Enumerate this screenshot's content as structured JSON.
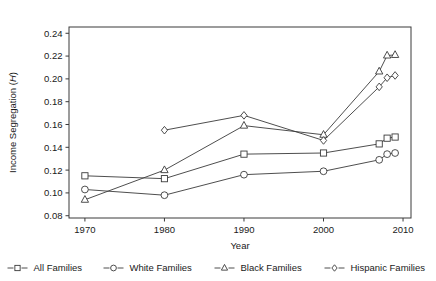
{
  "chart_data": {
    "type": "line",
    "title": "",
    "xlabel": "Year",
    "ylabel": "Income Segregation (H)",
    "ylabel_plain": "Income Segregation (",
    "ylabel_italic": "H",
    "ylabel_close": ")",
    "xlim": [
      1968,
      2011
    ],
    "ylim": [
      0.078,
      0.2455
    ],
    "grid": false,
    "legend_position": "bottom",
    "xticks": [
      1970,
      1980,
      1990,
      2000,
      2010
    ],
    "xtick_labels": [
      "1970",
      "1980",
      "1990",
      "2000",
      "2010"
    ],
    "yticks": [
      0.08,
      0.1,
      0.12,
      0.14,
      0.16,
      0.18,
      0.2,
      0.22,
      0.24
    ],
    "ytick_labels": [
      "0.08",
      "0.10",
      "0.12",
      "0.14",
      "0.16",
      "0.18",
      "0.20",
      "0.22",
      "0.24"
    ],
    "series": [
      {
        "name": "All Families",
        "marker": "square",
        "x": [
          1970,
          1980,
          1990,
          2000,
          2007,
          2008,
          2009
        ],
        "values": [
          0.115,
          0.1125,
          0.134,
          0.135,
          0.143,
          0.148,
          0.149
        ]
      },
      {
        "name": "White Families",
        "marker": "circle",
        "x": [
          1970,
          1980,
          1990,
          2000,
          2007,
          2008,
          2009
        ],
        "values": [
          0.103,
          0.098,
          0.116,
          0.119,
          0.129,
          0.134,
          0.135
        ]
      },
      {
        "name": "Black Families",
        "marker": "triangle",
        "x": [
          1970,
          1980,
          1990,
          2000,
          2007,
          2008,
          2009
        ],
        "values": [
          0.094,
          0.12,
          0.159,
          0.151,
          0.2065,
          0.2205,
          0.221
        ]
      },
      {
        "name": "Hispanic Families",
        "marker": "diamond",
        "x": [
          1980,
          1990,
          2000,
          2007,
          2008,
          2009
        ],
        "values": [
          0.155,
          0.168,
          0.146,
          0.193,
          0.201,
          0.203
        ]
      }
    ]
  },
  "legend": {
    "items": [
      {
        "label": "All Families",
        "marker": "square"
      },
      {
        "label": "White Families",
        "marker": "circle"
      },
      {
        "label": "Black Families",
        "marker": "triangle"
      },
      {
        "label": "Hispanic Families",
        "marker": "diamond"
      }
    ]
  },
  "colors": {
    "ink": "#3a3a3a",
    "text": "#1a1a1a",
    "background": "#ffffff",
    "marker_fill": "#ffffff"
  }
}
